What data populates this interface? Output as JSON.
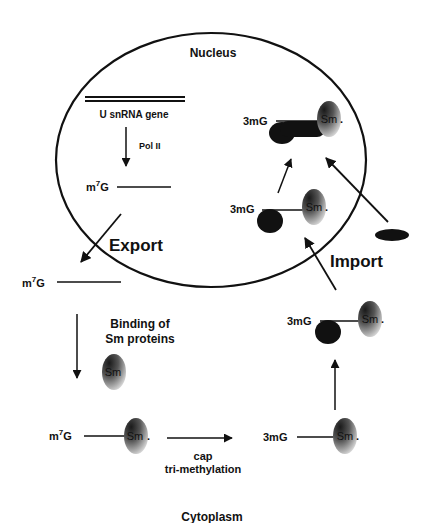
{
  "diagram": {
    "regions": {
      "nucleus": "Nucleus",
      "cytoplasm": "Cytoplasm"
    },
    "labels": {
      "gene": "U snRNA gene",
      "pol": "Pol II",
      "m7g_prefix": "m",
      "m7g_sup": "7",
      "m7g_suffix": "G",
      "export": "Export",
      "import": "Import",
      "binding_line1": "Binding of",
      "binding_line2": "Sm proteins",
      "cap_line1": "cap",
      "cap_line2": "tri-methylation",
      "tmg": "3mG",
      "sm": "Sm",
      "sm_dot": "."
    },
    "colors": {
      "ink": "#111111",
      "sm_dark": "#1a1a1a",
      "sm_light": "#d0d0d0",
      "background": "#ffffff"
    }
  }
}
